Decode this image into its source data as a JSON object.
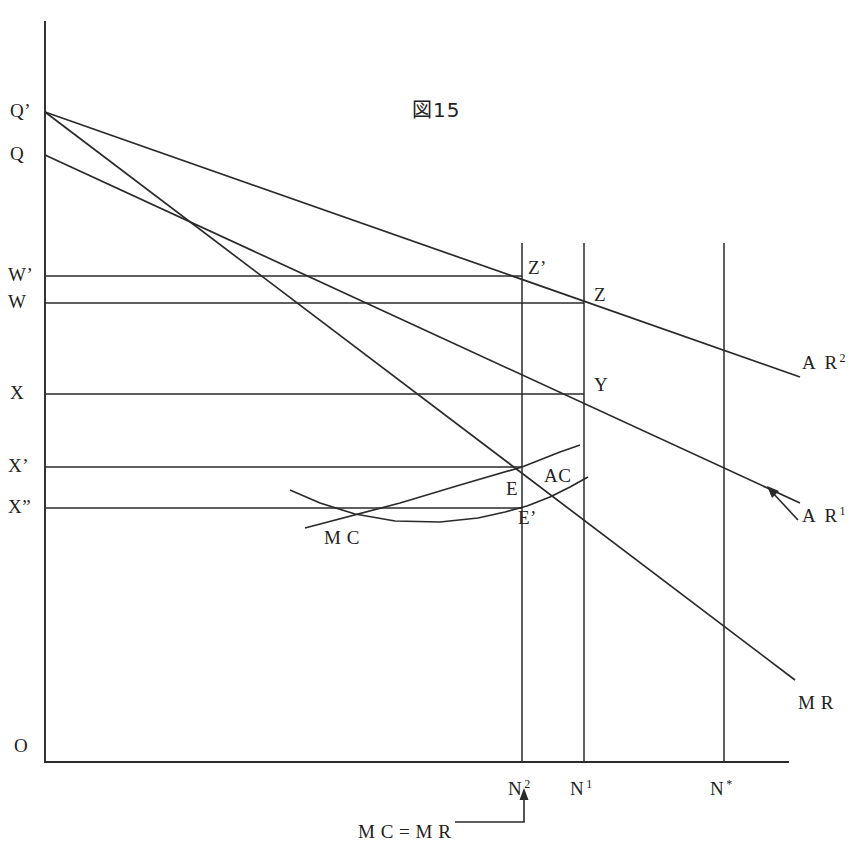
{
  "figure": {
    "title": "図15",
    "title_pos": {
      "x": 412,
      "y": 100
    }
  },
  "axes": {
    "origin_label": "O",
    "origin_pos": {
      "x": 14,
      "y": 736
    },
    "x_axis": {
      "x1": 45,
      "y1": 762,
      "x2": 788,
      "y2": 762
    },
    "y_axis": {
      "x1": 45,
      "y1": 22,
      "x2": 45,
      "y2": 762
    }
  },
  "y_levels": [
    {
      "name": "Q-prime",
      "label": "Q’",
      "y": 112,
      "label_x": 10,
      "has_rule": false,
      "rule_x2": 0
    },
    {
      "name": "Q",
      "label": "Q",
      "y": 155,
      "label_x": 10,
      "has_rule": false,
      "rule_x2": 0
    },
    {
      "name": "W-prime",
      "label": "W’",
      "y": 276,
      "label_x": 8,
      "has_rule": true,
      "rule_x2": 522
    },
    {
      "name": "W",
      "label": "W",
      "y": 303,
      "label_x": 8,
      "has_rule": true,
      "rule_x2": 584
    },
    {
      "name": "X",
      "label": "X",
      "y": 394,
      "label_x": 10,
      "has_rule": true,
      "rule_x2": 584
    },
    {
      "name": "X-prime",
      "label": "X’",
      "y": 467,
      "label_x": 8,
      "has_rule": true,
      "rule_x2": 522
    },
    {
      "name": "X-double-prime",
      "label": "X”",
      "y": 508,
      "label_x": 8,
      "has_rule": true,
      "rule_x2": 522
    }
  ],
  "x_verticals": [
    {
      "name": "N2",
      "label_base": "N",
      "label_sup": "2",
      "x": 522,
      "y_top": 243,
      "label_x": 508,
      "label_y": 778
    },
    {
      "name": "N1",
      "label_base": "N",
      "label_sup": "1",
      "x": 584,
      "y_top": 243,
      "label_x": 570,
      "label_y": 778
    },
    {
      "name": "Nstar",
      "label_base": "N",
      "label_sup": "*",
      "x": 724,
      "y_top": 243,
      "label_x": 710,
      "label_y": 778
    }
  ],
  "curves": [
    {
      "name": "AR2",
      "label": "A R",
      "sup": "2",
      "label_x": 802,
      "label_y": 352,
      "points": "45,112 800,377"
    },
    {
      "name": "AR1",
      "label": "A R",
      "sup": "1",
      "label_x": 802,
      "label_y": 505,
      "points": "45,155 800,503"
    },
    {
      "name": "MR",
      "label": "M R",
      "sup": "",
      "label_x": 798,
      "label_y": 693,
      "points": "45,112 795,680"
    },
    {
      "name": "MC",
      "label": "M C",
      "sup": "",
      "label_x": 324,
      "label_y": 528,
      "points": "305,528 400,503 460,485 522,467 560,452 580,445"
    },
    {
      "name": "AC",
      "label": "AC",
      "sup": "",
      "label_x": 544,
      "label_y": 466,
      "points": "290,490 320,503 355,514 395,521 440,522 478,518 505,512 527,506 550,497 570,487 588,477"
    }
  ],
  "points": [
    {
      "name": "Z-prime",
      "label": "Z’",
      "x": 522,
      "y": 276,
      "label_x": 528,
      "label_y": 258
    },
    {
      "name": "Z",
      "label": "Z",
      "x": 584,
      "y": 303,
      "label_x": 594,
      "label_y": 285
    },
    {
      "name": "Y",
      "label": "Y",
      "x": 584,
      "y": 394,
      "label_x": 594,
      "label_y": 375
    },
    {
      "name": "E",
      "label": "E",
      "x": 522,
      "y": 467,
      "label_x": 506,
      "label_y": 479
    },
    {
      "name": "E-prime",
      "label": "E’",
      "x": 522,
      "y": 508,
      "label_x": 518,
      "label_y": 508
    }
  ],
  "annotations": [
    {
      "name": "mc-equals-mr",
      "label": "M C = M R",
      "x": 358,
      "y": 822
    },
    {
      "name": "ar1-pointer-arrow",
      "label": "",
      "x": 770,
      "y": 490
    }
  ],
  "colors": {
    "ink": "#2a2a2a",
    "background": "#ffffff"
  }
}
